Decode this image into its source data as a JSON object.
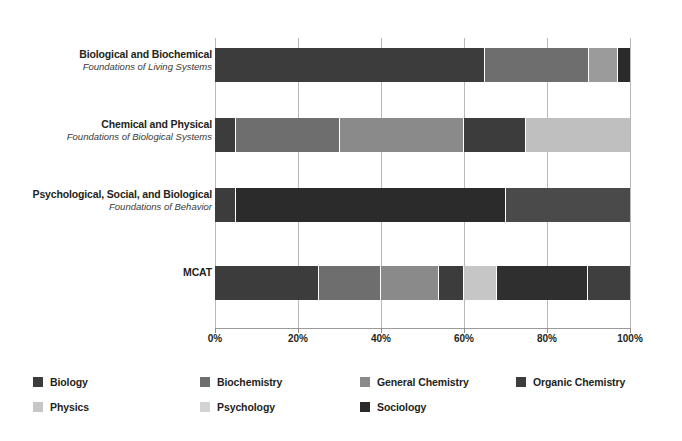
{
  "chart_data": {
    "type": "bar",
    "orientation": "horizontal",
    "stacked": true,
    "normalized": true,
    "title": "",
    "subtitle": "",
    "xlabel": "",
    "ylabel": "",
    "xlim": [
      0,
      100
    ],
    "xticks": [
      0,
      20,
      40,
      60,
      80,
      100
    ],
    "xtick_labels": [
      "0%",
      "20%",
      "40%",
      "60%",
      "80%",
      "100%"
    ],
    "grid": true,
    "grid_axis": "x",
    "legend_position": "bottom-left",
    "categories": [
      {
        "label": "Biological and Biochemical",
        "sublabel": "Foundations of Living Systems"
      },
      {
        "label": "Chemical and Physical",
        "sublabel": "Foundations of Biological Systems"
      },
      {
        "label": "Psychological, Social, and Biological",
        "sublabel": "Foundations of Behavior"
      },
      {
        "label": "MCAT",
        "sublabel": ""
      }
    ],
    "series": [
      {
        "name": "Biology",
        "color": "#3c3c3c",
        "values": [
          65,
          5,
          5,
          25
        ]
      },
      {
        "name": "Biochemistry",
        "color": "#6e6e6e",
        "values": [
          25,
          25,
          0,
          15
        ]
      },
      {
        "name": "General Chemistry",
        "color": "#8a8a8a",
        "values": [
          0,
          30,
          0,
          14
        ]
      },
      {
        "name": "Organic Chemistry",
        "color": "#3c3c3c",
        "values": [
          0,
          15,
          0,
          6
        ]
      },
      {
        "name": "Physics",
        "color": "#c6c6c6",
        "values": [
          0,
          25,
          0,
          8
        ]
      },
      {
        "name": "Psychology",
        "color": "#d3d3d3",
        "values": [
          7,
          0,
          65,
          22
        ]
      },
      {
        "name": "Sociology",
        "color": "#2b2b2b",
        "values": [
          3,
          0,
          25,
          10
        ]
      }
    ],
    "legend_entries": [
      {
        "label": "Biology",
        "color": "#3c3c3c"
      },
      {
        "label": "Biochemistry",
        "color": "#6e6e6e"
      },
      {
        "label": "General Chemistry",
        "color": "#8a8a8a"
      },
      {
        "label": "Organic Chemistry",
        "color": "#3c3c3c"
      },
      {
        "label": "Physics",
        "color": "#c6c6c6"
      },
      {
        "label": "Psychology",
        "color": "#d3d3d3"
      },
      {
        "label": "Sociology",
        "color": "#2b2b2b"
      }
    ],
    "bar_segments": [
      {
        "category": "Biological and Biochemical",
        "segments": [
          {
            "series": "Biology",
            "value": 65,
            "color": "#3c3c3c"
          },
          {
            "series": "Biochemistry",
            "value": 25,
            "color": "#6e6e6e"
          },
          {
            "series": "Psychology",
            "value": 7,
            "color": "#9b9b9b"
          },
          {
            "series": "Sociology",
            "value": 3,
            "color": "#2b2b2b"
          }
        ]
      },
      {
        "category": "Chemical and Physical",
        "segments": [
          {
            "series": "Biology",
            "value": 5,
            "color": "#3c3c3c"
          },
          {
            "series": "Biochemistry",
            "value": 25,
            "color": "#6e6e6e"
          },
          {
            "series": "General Chemistry",
            "value": 30,
            "color": "#8a8a8a"
          },
          {
            "series": "Organic Chemistry",
            "value": 15,
            "color": "#3c3c3c"
          },
          {
            "series": "Physics",
            "value": 25,
            "color": "#bfbfbf"
          }
        ]
      },
      {
        "category": "Psychological, Social, and Biological",
        "segments": [
          {
            "series": "Biology",
            "value": 5,
            "color": "#3c3c3c"
          },
          {
            "series": "Psychology",
            "value": 65,
            "color": "#2b2b2b"
          },
          {
            "series": "Sociology",
            "value": 30,
            "color": "#4a4a4a"
          }
        ]
      },
      {
        "category": "MCAT",
        "segments": [
          {
            "series": "Biology",
            "value": 25,
            "color": "#3c3c3c"
          },
          {
            "series": "Biochemistry",
            "value": 15,
            "color": "#6e6e6e"
          },
          {
            "series": "General Chemistry",
            "value": 14,
            "color": "#8a8a8a"
          },
          {
            "series": "Organic Chemistry",
            "value": 6,
            "color": "#3c3c3c"
          },
          {
            "series": "Physics",
            "value": 8,
            "color": "#c6c6c6"
          },
          {
            "series": "Psychology",
            "value": 22,
            "color": "#2f2f2f"
          },
          {
            "series": "Sociology",
            "value": 10,
            "color": "#3f3f3f"
          }
        ]
      }
    ]
  },
  "colors": {
    "gridline": "#b9b9b9",
    "axis": "#9a9a9a",
    "text": "#231f20",
    "background": "#ffffff"
  }
}
